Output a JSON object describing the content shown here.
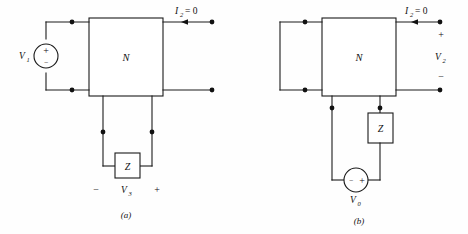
{
  "figure": {
    "background_color": "#fefefe",
    "line_color": "#1a1a1a",
    "text_color": "#111111"
  },
  "panel_a": {
    "caption": "(a)",
    "network_label": "N",
    "impedance_label": "Z",
    "source": {
      "label_main": "V",
      "label_sub": "1",
      "plus_sign": "+",
      "minus_sign": "−"
    },
    "current_annotation": {
      "symbol": "I",
      "sub": "2",
      "equals_zero": "= 0"
    },
    "bottom_voltage": {
      "minus_sign": "−",
      "label_main": "V",
      "label_sub": "3",
      "plus_sign": "+"
    }
  },
  "panel_b": {
    "caption": "(b)",
    "network_label": "N",
    "impedance_label": "Z",
    "source": {
      "label_main": "V",
      "label_sub": "0",
      "minus_sign": "−",
      "plus_sign": "+"
    },
    "current_annotation": {
      "symbol": "I",
      "sub": "2",
      "equals_zero": "= 0"
    },
    "output_voltage": {
      "plus_sign": "+",
      "label_main": "V",
      "label_sub": "2",
      "minus_sign": "−"
    }
  }
}
